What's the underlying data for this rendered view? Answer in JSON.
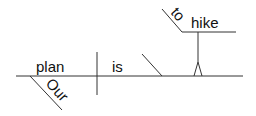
{
  "diagram": {
    "type": "sentence-diagram",
    "style": "Reed-Kellogg",
    "sentence_words": [
      "Our",
      "plan",
      "is",
      "to",
      "hike"
    ],
    "subject": "plan",
    "subject_modifier": "Our",
    "verb": "is",
    "infinitive_marker": "to",
    "predicate_nominative": "hike",
    "colors": {
      "line": "#333333",
      "text": "#111111",
      "background": "#ffffff"
    }
  }
}
